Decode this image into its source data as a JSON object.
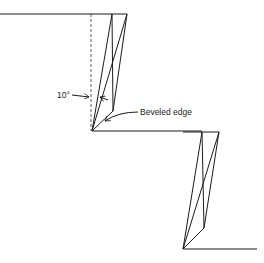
{
  "diagram": {
    "labels": {
      "angle": "10°",
      "bevel": "Beveled edge"
    },
    "colors": {
      "stroke": "#1a1a1a",
      "background": "#ffffff"
    }
  }
}
